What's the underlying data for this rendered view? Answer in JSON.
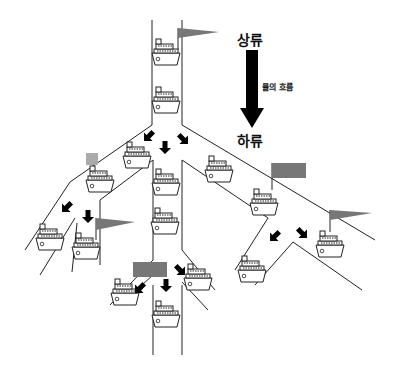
{
  "labels": {
    "upstream": "상류",
    "flow": "물의 흐름",
    "downstream": "하류"
  },
  "colors": {
    "line": "#222222",
    "flag": "#777777",
    "light_flag": "#aaaaaa",
    "arrow": "#000000"
  },
  "icons": {
    "ship": "ship-icon",
    "flag": "flag-icon",
    "rect_flag": "rect-flag-icon",
    "arrow": "flow-arrow-icon"
  }
}
